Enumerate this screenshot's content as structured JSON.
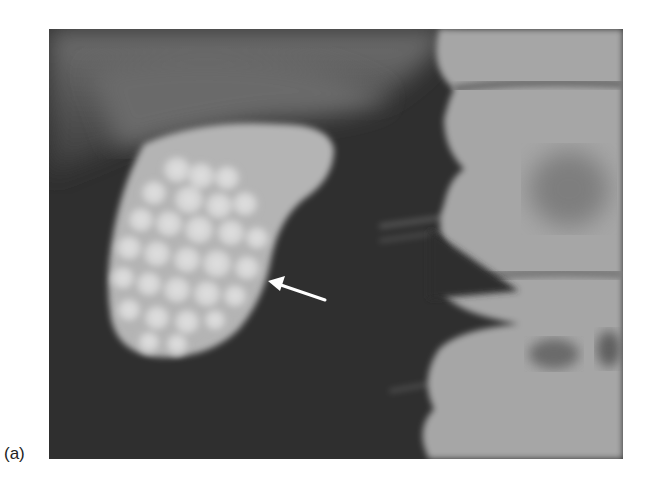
{
  "figure": {
    "panel_label": "(a)",
    "image_description": "Radiograph of contrast-filled gallbladder with numerous faceted filling defects (gallstones); lumbar vertebrae on the right",
    "annotations": [
      {
        "type": "arrow",
        "color": "#ffffff",
        "points_to": "gallbladder wall"
      }
    ],
    "colors": {
      "background_dark": "#2e2e2e",
      "gallbladder": "#b8b8b8",
      "stones": "#d6d6d6",
      "bone": "#a8a8a8"
    }
  }
}
